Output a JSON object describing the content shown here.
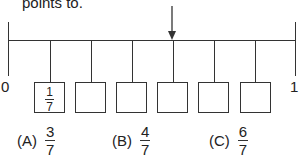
{
  "prompt_text": "points to.",
  "number_line": {
    "start_label": "0",
    "end_label": "1",
    "divisions": 7,
    "arrow_points_to_tick": 4
  },
  "boxes": [
    {
      "numerator": "1",
      "denominator": "7"
    },
    {
      "numerator": "",
      "denominator": ""
    },
    {
      "numerator": "",
      "denominator": ""
    },
    {
      "numerator": "",
      "denominator": ""
    },
    {
      "numerator": "",
      "denominator": ""
    },
    {
      "numerator": "",
      "denominator": ""
    }
  ],
  "choices": [
    {
      "label": "(A)",
      "numerator": "3",
      "denominator": "7"
    },
    {
      "label": "(B)",
      "numerator": "4",
      "denominator": "7"
    },
    {
      "label": "(C)",
      "numerator": "6",
      "denominator": "7"
    }
  ]
}
